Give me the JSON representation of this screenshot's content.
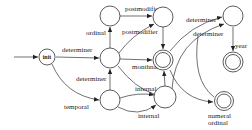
{
  "diagram": {
    "type": "finite-state-automaton",
    "nodes": {
      "init": {
        "label": "init",
        "final": false
      },
      "det": {
        "label": "",
        "final": false
      },
      "ord": {
        "label": "",
        "final": false
      },
      "temp": {
        "label": "",
        "final": false
      },
      "post": {
        "label": "",
        "final": false
      },
      "month": {
        "label": "",
        "final": true
      },
      "internal": {
        "label": "",
        "final": false
      },
      "det2": {
        "label": "",
        "final": false
      },
      "year": {
        "label": "",
        "final": true
      },
      "numord": {
        "label": "",
        "final": true
      }
    },
    "edge_labels": {
      "init_det": "determiner",
      "det_ord": "ordinal",
      "ord_post": "postmodifier",
      "det_post": "postmodifier",
      "det_month": "monthname",
      "temp_det": "determiner",
      "temp_internal_a": "internal",
      "temp_internal_b": "internal",
      "month_det2": "determiner",
      "month_det2_b": "determiner",
      "det2_year": "year",
      "internal_numord_a": "numeral",
      "internal_numord_b": "ordinal"
    }
  }
}
